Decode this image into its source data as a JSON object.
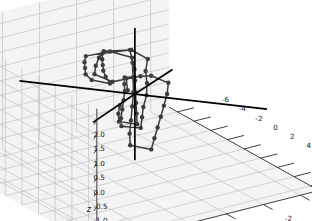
{
  "figure": {
    "width": 312,
    "height": 221,
    "background": "#ffffff",
    "pane_color": "#f2f2f2",
    "grid_color": "#b0b0b0",
    "axis_color": "#2b2b2b",
    "tick_text_color": "#1a1a1a"
  },
  "chart_data": {
    "type": "line",
    "projection": "3d",
    "title": "",
    "xlabel": "x",
    "ylabel": "y",
    "zlabel": "z",
    "grid": true,
    "legend": null,
    "xlim": [
      -7,
      11
    ],
    "ylim": [
      -5,
      7
    ],
    "zlim": [
      -2.4,
      2.4
    ],
    "xticks": [
      -6,
      -4,
      -2,
      0,
      2,
      4,
      6,
      8,
      10
    ],
    "yticks": [
      -4,
      -2,
      0,
      2,
      4,
      6
    ],
    "zticks": [
      -2.0,
      -1.5,
      -1.0,
      -0.5,
      0.0,
      0.5,
      1.0,
      1.5,
      2.0
    ],
    "xticklabels": [
      "-6",
      "-4",
      "-2",
      "0",
      "2",
      "4",
      "6",
      "8",
      "10"
    ],
    "yticklabels": [
      "-4",
      "-2",
      "0",
      "2",
      "4",
      "6"
    ],
    "zticklabels": [
      "-2.0",
      "-1.5",
      "-1.0",
      "-0.5",
      "0.0",
      "0.5",
      "1.0",
      "1.5",
      "2.0"
    ],
    "view": {
      "elev": 22,
      "azim": -56
    },
    "series": [
      {
        "name": "trajectory",
        "style": "line-with-markers",
        "color": "#3c3c3c",
        "marker": "o",
        "markersize": 2.2,
        "linewidth": 1.5,
        "points": [
          [
            -0.2,
            0.3,
            0.15
          ],
          [
            1.4,
            1.1,
            0.95
          ],
          [
            2.9,
            1.0,
            1.25
          ],
          [
            3.1,
            2.6,
            1.35
          ],
          [
            1.6,
            2.9,
            1.42
          ],
          [
            0.2,
            2.2,
            1.38
          ],
          [
            -1.2,
            1.4,
            1.3
          ],
          [
            -2.4,
            0.6,
            1.2
          ],
          [
            -2.2,
            -0.8,
            1.05
          ],
          [
            -0.9,
            -1.1,
            0.9
          ],
          [
            0.4,
            -0.4,
            0.8
          ],
          [
            1.9,
            0.2,
            0.72
          ],
          [
            3.4,
            0.9,
            0.65
          ],
          [
            4.8,
            1.7,
            0.6
          ],
          [
            6.2,
            2.4,
            0.58
          ],
          [
            7.6,
            3.1,
            0.55
          ],
          [
            6.4,
            3.6,
            0.5
          ],
          [
            5.0,
            3.0,
            0.45
          ],
          [
            3.6,
            2.3,
            0.42
          ],
          [
            2.2,
            1.6,
            0.4
          ],
          [
            0.8,
            0.9,
            0.38
          ],
          [
            -0.6,
            0.3,
            0.3
          ],
          [
            -1.9,
            -0.3,
            0.22
          ],
          [
            -1.6,
            -1.6,
            0.12
          ],
          [
            -0.2,
            -1.9,
            0.05
          ],
          [
            1.2,
            -1.2,
            0.0
          ],
          [
            2.6,
            -0.4,
            -0.05
          ],
          [
            4.0,
            0.4,
            -0.08
          ],
          [
            5.4,
            1.2,
            -0.1
          ],
          [
            6.8,
            2.0,
            -0.12
          ],
          [
            8.2,
            2.8,
            -0.15
          ],
          [
            7.0,
            3.4,
            -0.1
          ],
          [
            5.6,
            2.8,
            -0.02
          ],
          [
            4.2,
            2.1,
            0.1
          ],
          [
            2.8,
            1.4,
            0.25
          ],
          [
            1.4,
            0.7,
            0.42
          ],
          [
            0.0,
            0.1,
            0.6
          ],
          [
            -1.4,
            -0.5,
            0.78
          ],
          [
            -2.8,
            -1.0,
            0.92
          ],
          [
            -3.0,
            0.4,
            1.0
          ],
          [
            -1.7,
            1.0,
            1.1
          ],
          [
            -0.3,
            1.6,
            1.22
          ],
          [
            1.1,
            2.2,
            1.35
          ],
          [
            2.5,
            2.7,
            1.45
          ],
          [
            3.9,
            3.1,
            1.5
          ],
          [
            2.6,
            3.5,
            1.48
          ],
          [
            1.2,
            3.2,
            1.4
          ],
          [
            -0.2,
            2.6,
            1.3
          ],
          [
            -1.6,
            2.0,
            1.18
          ],
          [
            -3.0,
            1.3,
            1.05
          ],
          [
            -3.2,
            -0.1,
            0.95
          ],
          [
            -1.9,
            -0.7,
            0.85
          ],
          [
            -0.5,
            -0.2,
            0.75
          ],
          [
            0.9,
            0.4,
            0.68
          ],
          [
            2.3,
            1.0,
            0.6
          ],
          [
            3.7,
            1.6,
            0.55
          ],
          [
            5.1,
            2.2,
            0.5
          ],
          [
            6.5,
            2.8,
            0.45
          ],
          [
            5.2,
            3.2,
            0.4
          ],
          [
            3.8,
            2.6,
            0.35
          ],
          [
            2.4,
            1.9,
            0.3
          ]
        ]
      }
    ],
    "vectors": [
      {
        "name": "axis-vector-1",
        "color": "#000000",
        "from": [
          0,
          0,
          0
        ],
        "to": [
          0,
          0,
          2.3
        ],
        "linewidth": 1.7
      },
      {
        "name": "axis-vector-2",
        "color": "#000000",
        "from": [
          0,
          0,
          0
        ],
        "to": [
          0,
          0,
          -2.3
        ],
        "linewidth": 1.7
      },
      {
        "name": "axis-vector-3",
        "color": "#000000",
        "from": [
          0,
          0,
          0
        ],
        "to": [
          -6.3,
          3.4,
          0.0
        ],
        "linewidth": 1.7
      },
      {
        "name": "axis-vector-4",
        "color": "#000000",
        "from": [
          0,
          0,
          0
        ],
        "to": [
          7.2,
          -3.9,
          0.0
        ],
        "linewidth": 1.7
      },
      {
        "name": "axis-vector-5",
        "color": "#000000",
        "from": [
          0,
          0,
          0
        ],
        "to": [
          -4.6,
          -4.1,
          -0.55
        ],
        "linewidth": 1.7
      },
      {
        "name": "axis-vector-6",
        "color": "#000000",
        "from": [
          0,
          0,
          0
        ],
        "to": [
          5.2,
          4.6,
          0.6
        ],
        "linewidth": 1.7
      }
    ]
  }
}
